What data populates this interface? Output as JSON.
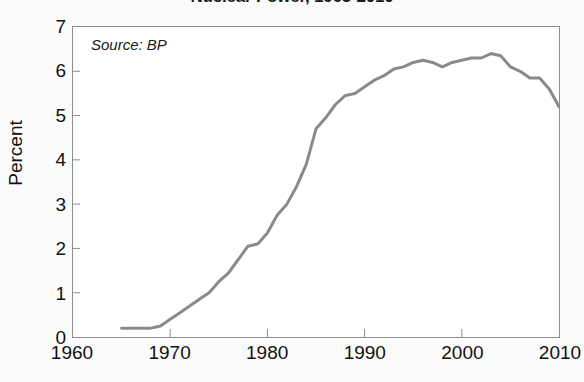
{
  "chart_data": {
    "type": "line",
    "title": "Nuclear Power, 1965-2010",
    "xlabel": "",
    "ylabel": "Percent",
    "xlim": [
      1960,
      2010
    ],
    "ylim": [
      0,
      7
    ],
    "xticks": [
      1960,
      1970,
      1980,
      1990,
      2000,
      2010
    ],
    "yticks": [
      0,
      1,
      2,
      3,
      4,
      5,
      6,
      7
    ],
    "grid": false,
    "legend": null,
    "annotations": [
      {
        "text": "Source: BP",
        "position": "inside-top-left",
        "style": "italic"
      }
    ],
    "line_color": "#8a8a8a",
    "line_width": 3,
    "series": [
      {
        "name": "Nuclear share of world energy",
        "x": [
          1965,
          1966,
          1967,
          1968,
          1969,
          1970,
          1971,
          1972,
          1973,
          1974,
          1975,
          1976,
          1977,
          1978,
          1979,
          1980,
          1981,
          1982,
          1983,
          1984,
          1985,
          1986,
          1987,
          1988,
          1989,
          1990,
          1991,
          1992,
          1993,
          1994,
          1995,
          1996,
          1997,
          1998,
          1999,
          2000,
          2001,
          2002,
          2003,
          2004,
          2005,
          2006,
          2007,
          2008,
          2009,
          2010
        ],
        "values": [
          0.2,
          0.2,
          0.2,
          0.2,
          0.25,
          0.4,
          0.55,
          0.7,
          0.85,
          1.0,
          1.25,
          1.45,
          1.75,
          2.05,
          2.1,
          2.35,
          2.75,
          3.0,
          3.4,
          3.9,
          4.7,
          4.95,
          5.25,
          5.45,
          5.5,
          5.65,
          5.8,
          5.9,
          6.05,
          6.1,
          6.2,
          6.25,
          6.2,
          6.1,
          6.2,
          6.25,
          6.3,
          6.3,
          6.4,
          6.35,
          6.1,
          6.0,
          5.85,
          5.85,
          5.6,
          5.2
        ],
        "units": "percent"
      }
    ]
  },
  "axes": {
    "y_tick_labels": [
      "7",
      "6",
      "5",
      "4",
      "3",
      "2",
      "1",
      "0"
    ],
    "y_axis_title": "Percent",
    "x_tick_labels": [
      "1960",
      "1970",
      "1980",
      "1990",
      "2000",
      "2010"
    ]
  },
  "source_note": "Source: BP"
}
